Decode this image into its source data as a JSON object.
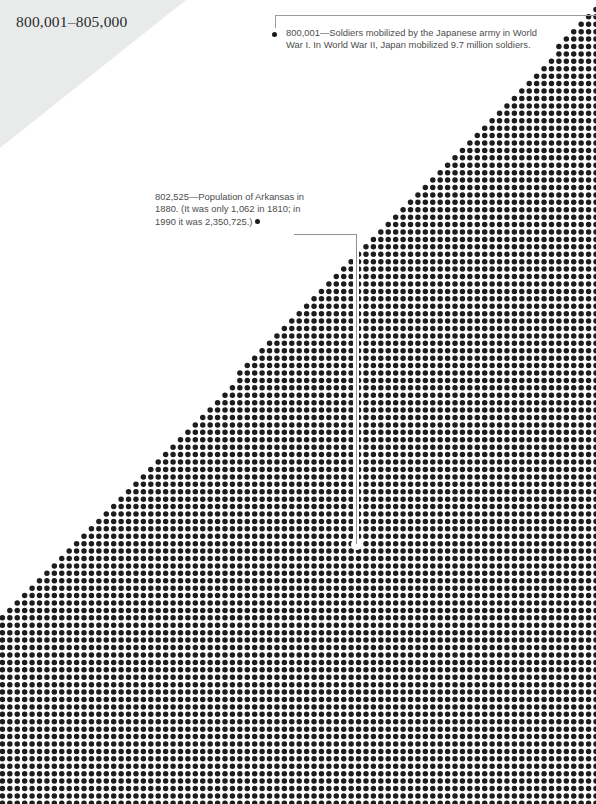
{
  "page": {
    "width": 596,
    "height": 804,
    "background": "#ffffff",
    "ink_color": "#1a1a1a",
    "banner_color": "#e9ebeb",
    "leader_line_color": "#9a9d9f",
    "text_color": "#4d4d4d"
  },
  "header": {
    "title": "800,001–805,000",
    "range_start": 800001,
    "range_end": 805000
  },
  "annotations": [
    {
      "id": "soldiers-japan-ww1",
      "value_label": "800,001",
      "separator": "—",
      "text": "800,001—Soldiers mobilized by the Japanese army in World War I. In World War II, Japan mobilized 9.7 million soldiers.",
      "lines": [
        "800,001—Soldiers mobilized by the Japanese",
        "army in World War I. In World War II, Japan",
        "mobilized 9.7 million soldiers."
      ],
      "bullet": "●",
      "leader": {
        "shape": "vertical-stub-then-horizontal-rule",
        "x": 275,
        "y": 15
      }
    },
    {
      "id": "population-arkansas-1880",
      "value_label": "802,525",
      "separator": "—",
      "text": "802,525—Population of Arkansas in 1880. (It was only 1,062 in 1810; in 1990 it was 2,350,725.)",
      "lines": [
        "802,525—Population of Arkansas in",
        "1880. (It was only 1,062 in 1810; in",
        "1990 it was 2,350,725.)"
      ],
      "bullet": "●",
      "leader": {
        "shape": "horizontal-then-vertical",
        "x": 356,
        "y": 234,
        "drop_to_y": 544
      }
    }
  ],
  "chart_data": {
    "type": "scatter",
    "title": "800,001–805,000",
    "xlabel": "",
    "ylabel": "",
    "grid": false,
    "legend_position": "none",
    "dot_grid": {
      "pitch_x": 7.42,
      "pitch_y": 7.42,
      "dot_radius": 2.75,
      "columns": 81,
      "rows": 109,
      "origin_x": 2.4,
      "origin_y": 2.0,
      "fill": "#1d1d1d",
      "mask": "lower-right triangle; a dot at column c, row r is drawn when (c/columns) + (1 - r/rows) >= 1 (approximately)",
      "apex_top_right": [
        596,
        10
      ],
      "apex_bottom_left": [
        0,
        620
      ],
      "marked_missing_dot": {
        "column": 48,
        "row": 73,
        "x": 356,
        "y": 544
      }
    },
    "series": [
      {
        "name": "dots",
        "marker": "filled-circle",
        "count_visible_approx": 4200
      }
    ],
    "annotated_points": [
      {
        "label": "800,001",
        "note": "Soldiers mobilized by the Japanese army in World War I. In World War II, Japan mobilized 9.7 million soldiers.",
        "x": 596,
        "y": 15
      },
      {
        "label": "802,525",
        "note": "Population of Arkansas in 1880. (It was only 1,062 in 1810; in 1990 it was 2,350,725.)",
        "x": 356,
        "y": 544
      }
    ]
  }
}
